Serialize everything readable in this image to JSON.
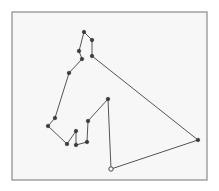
{
  "diagram": {
    "type": "polyline-path",
    "frame": {
      "x": 12,
      "y": 12,
      "width": 195,
      "height": 168
    },
    "colors": {
      "line": "#555555",
      "point": "#3a3a3a",
      "frame": "#8a8a8a",
      "background": "#f7f7f7"
    },
    "start_point": {
      "x": 111,
      "y": 169,
      "style": "open-circle"
    },
    "points": [
      {
        "x": 111,
        "y": 169
      },
      {
        "x": 108,
        "y": 99
      },
      {
        "x": 88,
        "y": 121
      },
      {
        "x": 87,
        "y": 142
      },
      {
        "x": 76,
        "y": 145
      },
      {
        "x": 76,
        "y": 131
      },
      {
        "x": 67,
        "y": 144
      },
      {
        "x": 48,
        "y": 126
      },
      {
        "x": 55,
        "y": 118
      },
      {
        "x": 69,
        "y": 73
      },
      {
        "x": 82,
        "y": 59
      },
      {
        "x": 79,
        "y": 51
      },
      {
        "x": 84,
        "y": 32
      },
      {
        "x": 92,
        "y": 40
      },
      {
        "x": 92,
        "y": 56
      },
      {
        "x": 198,
        "y": 140
      },
      {
        "x": 111,
        "y": 169
      }
    ]
  }
}
